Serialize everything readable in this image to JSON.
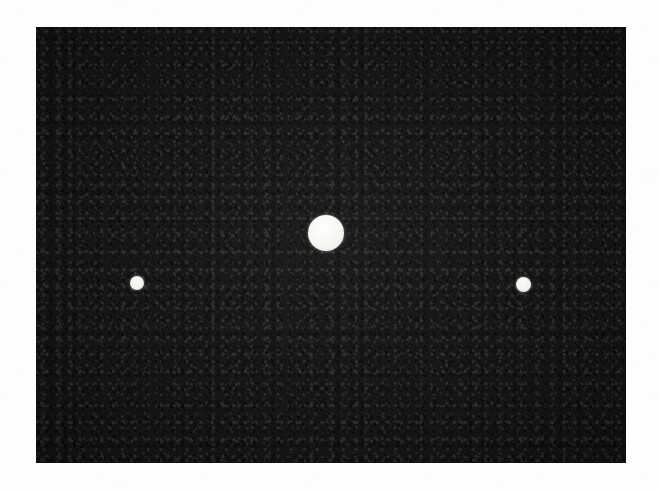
{
  "figure": {
    "caption": "",
    "background_color": "#fdfdfb",
    "plate": {
      "label": "dark-field plate",
      "fill_color": "#131313",
      "grain_color": "#2e2e2e",
      "x": 36,
      "y": 27,
      "width": 590,
      "height": 436
    },
    "spots": [
      {
        "id": "spot-left",
        "role": "secondary",
        "label": "left satellite spot",
        "color": "#f2f2ef",
        "center_x": 137,
        "center_y": 283,
        "diameter": 14
      },
      {
        "id": "spot-center",
        "role": "primary",
        "label": "central bright spot",
        "color": "#f5f5f2",
        "center_x": 326,
        "center_y": 233,
        "diameter": 36
      },
      {
        "id": "spot-right",
        "role": "secondary",
        "label": "right satellite spot",
        "color": "#f2f2ef",
        "center_x": 523,
        "center_y": 284,
        "diameter": 15
      }
    ]
  }
}
